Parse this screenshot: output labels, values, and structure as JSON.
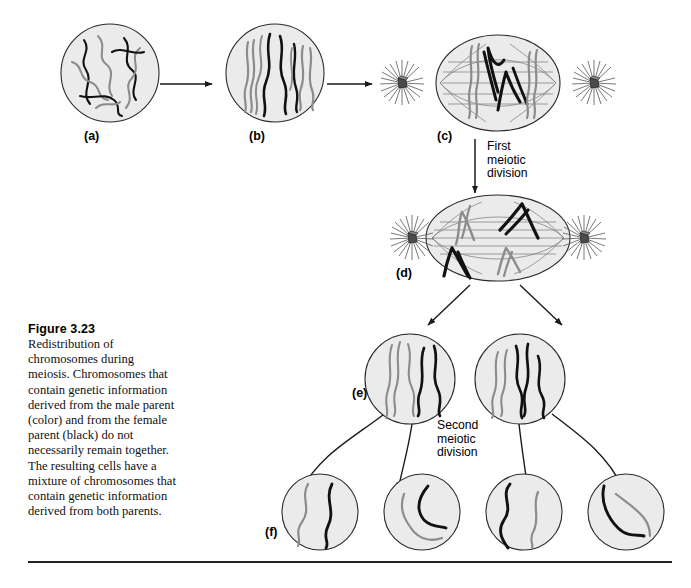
{
  "figure": {
    "number": "Figure 3.23",
    "caption": "Redistribution of chromosomes during meiosis. Chromosomes that contain genetic information derived from the male parent (color) and from the female parent (black) do not necessarily remain together. The resulting cells have a mixture of chromosomes that contain genetic information derived from both parents."
  },
  "stage_labels": {
    "a": "(a)",
    "b": "(b)",
    "c": "(c)",
    "d": "(d)",
    "e": "(e)",
    "f": "(f)"
  },
  "annotations": {
    "first_division_line1": "First",
    "first_division_line2": "meiotic",
    "first_division_line3": "division",
    "second_division_line1": "Second",
    "second_division_line2": "meiotic",
    "second_division_line3": "division"
  },
  "colors": {
    "cell_fill": "#ebebeb",
    "cell_stroke": "#2b2b2b",
    "paternal_chromosome": "#8c8c8c",
    "maternal_chromosome": "#111111",
    "spindle": "#6f6f6f",
    "arrow": "#1a1a1a",
    "rule": "#222222",
    "background": "#ffffff"
  },
  "diagram": {
    "type": "meiosis-process-diagram",
    "stages": [
      {
        "id": "a",
        "name": "leptotene-chromatin-threads",
        "cell_count": 1,
        "description": "tangled thin chromatin threads, gray and black intermixed"
      },
      {
        "id": "b",
        "name": "condensed-homologous-chromosomes",
        "cell_count": 1,
        "description": "four paired homologous chromosomes condensed, gray and black"
      },
      {
        "id": "c",
        "name": "metaphase-I",
        "cell_count": 1,
        "description": "spindle with two centrosomes and asters, chromosomes aligned at equator"
      },
      {
        "id": "d",
        "name": "anaphase-I",
        "cell_count": 1,
        "description": "V-shaped chromosomes migrating toward opposite poles"
      },
      {
        "id": "e",
        "name": "daughter-cells-after-first-division",
        "cell_count": 2,
        "description": "each daughter cell contains a mixture of gray and black chromosomes"
      },
      {
        "id": "f",
        "name": "gametes-after-second-division",
        "cell_count": 4,
        "description": "each gamete contains one gray and one black chromosome"
      }
    ]
  }
}
